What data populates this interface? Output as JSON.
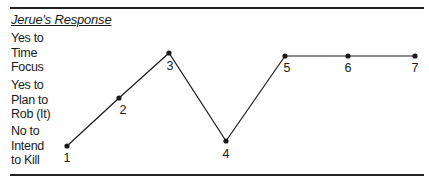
{
  "chart_data": {
    "type": "line",
    "title": "Jerue's Response",
    "xlabel": "",
    "ylabel": "",
    "y_levels": [
      {
        "value": 1,
        "label": "No to\nIntend\nto Kill"
      },
      {
        "value": 2,
        "label": "Yes to\nPlan to\nRob (It)"
      },
      {
        "value": 3,
        "label": "Yes to\nTime\nFocus"
      }
    ],
    "x": [
      1,
      2,
      3,
      4,
      5,
      6,
      7
    ],
    "point_labels": [
      "1",
      "2",
      "3",
      "4",
      "5",
      "6",
      "7"
    ],
    "values": [
      1,
      2,
      3,
      1,
      3,
      3,
      3
    ],
    "grid": false,
    "legend": null
  },
  "title": "Jerue's Response",
  "y_labels": [
    "Yes to\nTime\nFocus",
    "Yes to\nPlan to\nRob (It)",
    "No to\nIntend\nto Kill"
  ],
  "points": [
    {
      "label": "1",
      "x": 67,
      "y": 146,
      "lx": 67,
      "ly": 162
    },
    {
      "label": "2",
      "x": 119,
      "y": 98,
      "lx": 123,
      "ly": 114
    },
    {
      "label": "3",
      "x": 169,
      "y": 53,
      "lx": 170,
      "ly": 70
    },
    {
      "label": "4",
      "x": 226,
      "y": 141,
      "lx": 226,
      "ly": 158
    },
    {
      "label": "5",
      "x": 285,
      "y": 56,
      "lx": 287,
      "ly": 72
    },
    {
      "label": "6",
      "x": 348,
      "y": 56,
      "lx": 348,
      "ly": 72
    },
    {
      "label": "7",
      "x": 415,
      "y": 56,
      "lx": 415,
      "ly": 72
    }
  ],
  "colors": {
    "line": "#1a1a1a",
    "rule": "#222222",
    "text": "#1a1a1a",
    "background": "#ffffff"
  }
}
